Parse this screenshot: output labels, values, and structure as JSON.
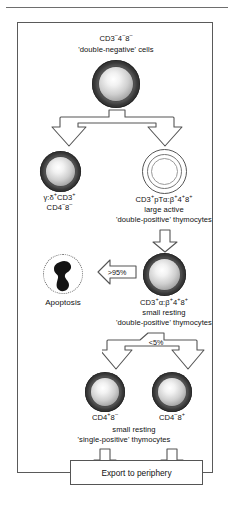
{
  "figure": {
    "panel_border_color": "#5a5a5a"
  },
  "stages": {
    "double_negative": {
      "marker": "CD3−4−8−",
      "marker_parts": {
        "base": "CD3",
        "sup1": "–",
        "mid": "4",
        "sup2": "–",
        "mid2": "8",
        "sup3": "–"
      },
      "description": "'double-negative' cells",
      "cell_style": "filled-dark"
    },
    "gamma_delta": {
      "line1": "γ:δ+CD3+",
      "line2": "CD4−8−",
      "cell_style": "filled-dark"
    },
    "large_active_dp": {
      "line1": "CD3+pTα:β+4+8+",
      "line2": "large active",
      "line3": "'double-positive' thymocytes",
      "cell_style": "hollow-outline"
    },
    "small_resting_dp": {
      "line1": "CD3+α:β+4+8+",
      "line2": "small resting",
      "line3": "'double-positive' thymocytes",
      "cell_style": "filled-dark"
    },
    "apoptosis": {
      "label": "Apoptosis",
      "cell_style": "dotted-blob"
    },
    "cd4_sp": {
      "label": "CD4+8−",
      "cell_style": "filled-dark"
    },
    "cd8_sp": {
      "label": "CD4−8+",
      "cell_style": "filled-dark"
    },
    "single_positive_caption": {
      "line1": "small resting",
      "line2": "'single-positive' thymocytes"
    },
    "export": {
      "label": "Export to periphery"
    }
  },
  "flows": {
    "apoptosis_fraction": ">95%",
    "maturation_fraction": "<5%"
  },
  "icons": {
    "split_arrow": "split-down-arrow-icon",
    "down_arrow": "down-arrow-icon",
    "left_arrow": "left-arrow-icon"
  }
}
